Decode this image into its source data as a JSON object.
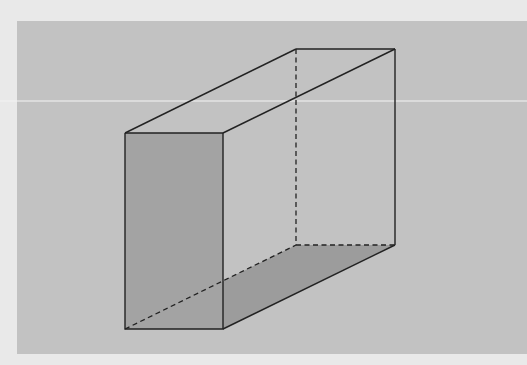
{
  "figure": {
    "type": "rectangular-prism",
    "colors": {
      "outer_background": "#e9e9e9",
      "panel_background": "#c2c2c2",
      "front_face": "#a3a3a3",
      "bottom_face": "#9c9c9c",
      "edge": "#222222",
      "scan_line": "#f4f4f4"
    },
    "vertices": {
      "front_top_left": [
        125,
        133
      ],
      "front_top_right": [
        223,
        133
      ],
      "front_bottom_left": [
        125,
        329
      ],
      "front_bottom_right": [
        223,
        329
      ],
      "back_top_left": [
        296,
        49
      ],
      "back_top_right": [
        395,
        49
      ],
      "back_bottom_left": [
        296,
        245
      ],
      "back_bottom_right": [
        395,
        245
      ]
    },
    "hidden_edges": [
      "back_top_left-back_bottom_left",
      "back_bottom_left-back_bottom_right",
      "front_bottom_left-back_bottom_left"
    ],
    "shaded_faces": [
      "front",
      "bottom"
    ]
  }
}
